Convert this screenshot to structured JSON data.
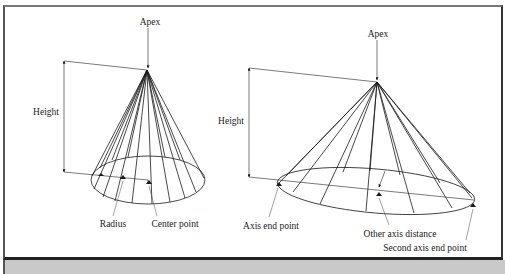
{
  "figure": {
    "panels": [
      {
        "name": "right-circular-cone",
        "labels": {
          "apex": "Apex",
          "height": "Height",
          "radius": "Radius",
          "center_point": "Center point"
        }
      },
      {
        "name": "elliptical-cone",
        "labels": {
          "apex": "Apex",
          "height": "Height",
          "axis_end_point": "Axis end point",
          "other_axis_distance": "Other axis distance",
          "second_axis_end_point": "Second axis end point"
        }
      }
    ],
    "colors": {
      "line": "#1a1a1a",
      "background": "#ffffff",
      "bottom_band": "#c9c9c9"
    }
  }
}
